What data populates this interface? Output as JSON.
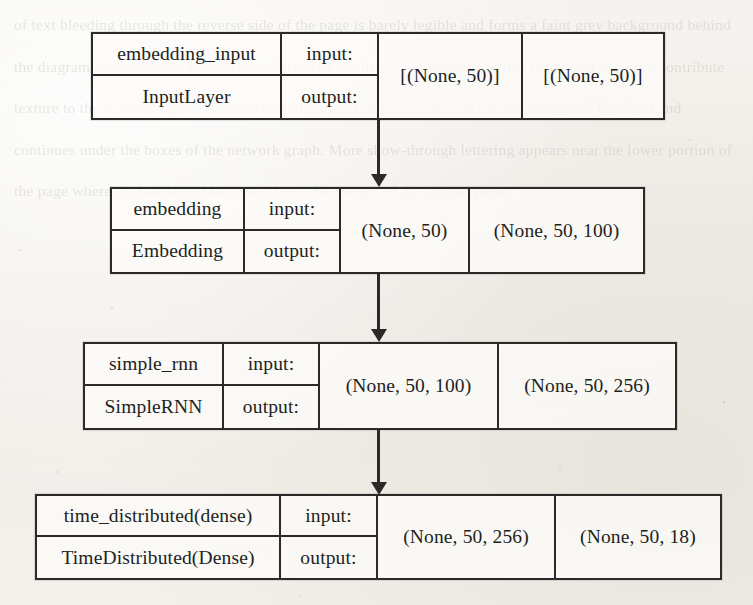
{
  "page": {
    "background_color": "#f2f0ec",
    "ink_color": "#2b2a28",
    "width": 753,
    "height": 605
  },
  "diagram": {
    "type": "keras-model-plot",
    "orientation": "top-to-bottom",
    "labels": {
      "input": "input:",
      "output": "output:"
    },
    "nodes": [
      {
        "id": "embedding_input",
        "layer_name": "embedding_input",
        "layer_type": "InputLayer",
        "input_label": "input:",
        "output_label": "output:",
        "input_shape": "[(None, 50)]",
        "output_shape": "[(None, 50)]"
      },
      {
        "id": "embedding",
        "layer_name": "embedding",
        "layer_type": "Embedding",
        "input_label": "input:",
        "output_label": "output:",
        "input_shape": "(None, 50)",
        "output_shape": "(None, 50, 100)"
      },
      {
        "id": "simple_rnn",
        "layer_name": "simple_rnn",
        "layer_type": "SimpleRNN",
        "input_label": "input:",
        "output_label": "output:",
        "input_shape": "(None, 50, 100)",
        "output_shape": "(None, 50, 256)"
      },
      {
        "id": "time_distributed",
        "layer_name": "time_distributed(dense)",
        "layer_type": "TimeDistributed(Dense)",
        "input_label": "input:",
        "output_label": "output:",
        "input_shape": "(None, 50, 256)",
        "output_shape": "(None, 50, 18)"
      }
    ],
    "edges": [
      {
        "from": "embedding_input",
        "to": "embedding"
      },
      {
        "from": "embedding",
        "to": "simple_rnn"
      },
      {
        "from": "simple_rnn",
        "to": "time_distributed"
      }
    ]
  },
  "scan_bleed_text": "of text bleeding through the reverse side of the page is barely legible and forms a faint grey background behind the diagram shown on this printed page here. The words are not readable at this resolution and only contribute texture to the scanned figure. Another line of ghosted characters runs across the middle of the sheet and continues under the boxes of the network graph. More show-through lettering appears near the lower portion of the page where the last layer block sits above the margin of the printed paper."
}
